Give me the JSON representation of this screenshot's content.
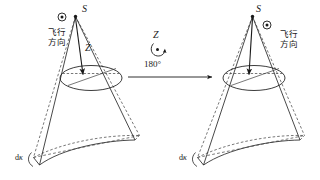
{
  "figure": {
    "title_alt": "Sensor viewing cone before and after 180 degree rotation about Z axis",
    "colors": {
      "stroke": "#1a1a1a",
      "background": "#ffffff",
      "dashed": "#4a4a4a"
    },
    "left_diagram": {
      "name": "before-rotation",
      "apex_label": "S",
      "axis_label": "Z",
      "flight_direction_line1": "飞行",
      "flight_direction_line2": "方向",
      "nadir_symbol": "⊙",
      "kappa_label_prefix": "d",
      "kappa_label_symbol": "κ"
    },
    "rotation": {
      "name": "rotation-annotation",
      "axis_label": "Z",
      "angle_label": "180°",
      "arrow_direction": "right"
    },
    "right_diagram": {
      "name": "after-rotation",
      "apex_label": "S",
      "axis_label": "",
      "flight_direction_line1": "飞行",
      "flight_direction_line2": "方向",
      "nadir_symbol": "⊙",
      "kappa_label_prefix": "d",
      "kappa_label_symbol": "κ"
    }
  }
}
